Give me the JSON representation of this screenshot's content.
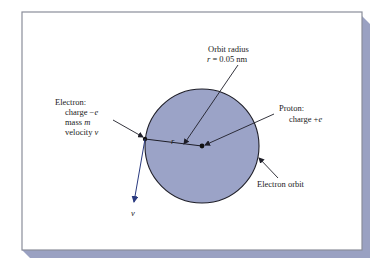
{
  "colors": {
    "frame_border": "#8a8e9a",
    "shadow": "#9aa1c2",
    "orbit_fill": "#9ba3c7",
    "orbit_stroke": "#1e1e28",
    "velocity_arrow": "#2a3a80",
    "text": "#222222"
  },
  "diagram": {
    "orbit_label": {
      "line1": "Orbit radius",
      "line2_var": "r",
      "line2_rest": " = 0.05 nm"
    },
    "electron_label": {
      "title": "Electron:",
      "charge_prefix": "charge −",
      "charge_var": "e",
      "mass_prefix": "mass ",
      "mass_var": "m",
      "velocity_prefix": "velocity ",
      "velocity_var": "v"
    },
    "proton_label": {
      "title": "Proton:",
      "charge_prefix": "charge +",
      "charge_var": "e"
    },
    "orbit_caption": "Electron orbit",
    "radius_symbol": "r",
    "velocity_symbol": "v"
  }
}
